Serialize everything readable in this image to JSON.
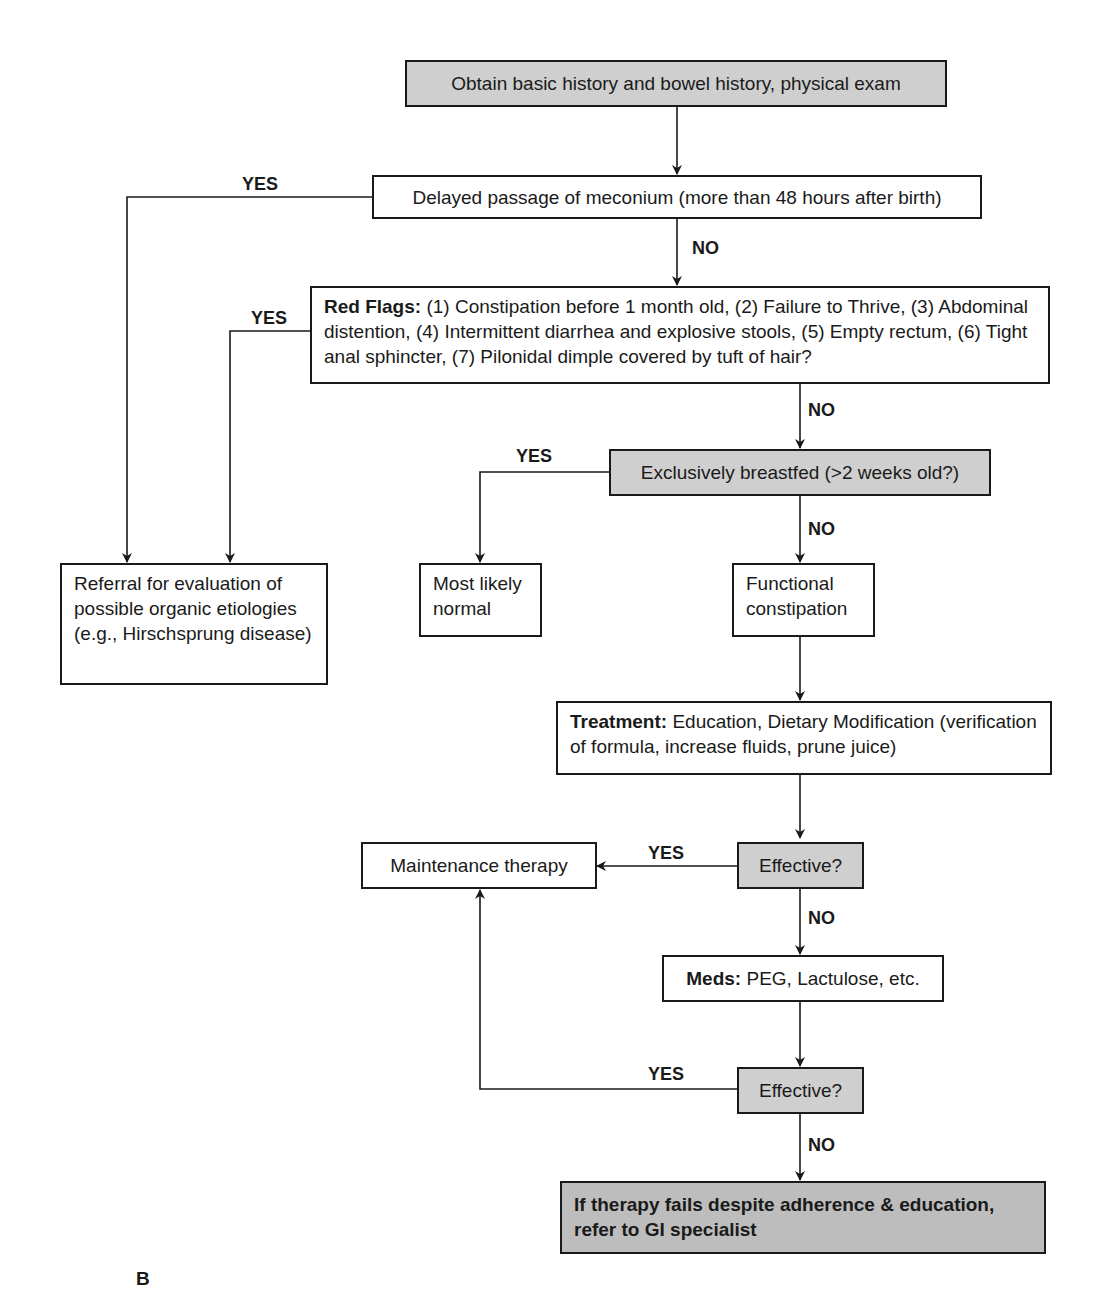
{
  "figure_label": "B",
  "nodes": {
    "history": "Obtain basic history and bowel history, physical exam",
    "meconium": "Delayed passage of meconium (more than 48 hours after birth)",
    "red_flags_title": "Red Flags:",
    "red_flags_text": "(1) Constipation before 1 month old, (2) Failure to Thrive, (3) Abdominal distention, (4) Intermittent diarrhea and explosive stools, (5) Empty rectum, (6) Tight anal sphincter, (7) Pilonidal dimple covered by tuft of hair?",
    "breastfed": "Exclusively breastfed (>2 weeks old?)",
    "referral": "Referral for evaluation of possible organic etiologies (e.g., Hirschsprung disease)",
    "normal": "Most likely normal",
    "functional": "Functional constipation",
    "treatment_title": "Treatment:",
    "treatment_text": "Education, Dietary Modification (verification of formula, increase fluids, prune juice)",
    "maintenance": "Maintenance therapy",
    "effective1": "Effective?",
    "meds_title": "Meds:",
    "meds_text": "PEG, Lactulose, etc.",
    "effective2": "Effective?",
    "gi_referral": "If therapy fails despite adherence & education, refer to GI specialist"
  },
  "edge_labels": {
    "meconium_yes": "YES",
    "meconium_no": "NO",
    "redflags_yes": "YES",
    "redflags_no": "NO",
    "breastfed_yes": "YES",
    "breastfed_no": "NO",
    "effective1_yes": "YES",
    "effective1_no": "NO",
    "effective2_yes": "YES",
    "effective2_no": "NO"
  }
}
